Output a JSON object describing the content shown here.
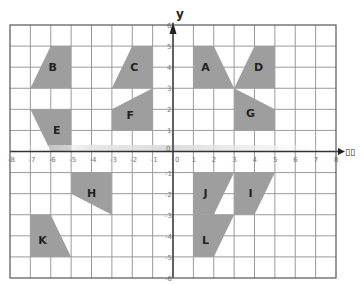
{
  "diagram": {
    "title": "",
    "x_axis_label": "x",
    "x_axis_label_rendered": "▯▯",
    "y_axis_label": "y",
    "x_range": [
      -8,
      8
    ],
    "y_range": [
      -6,
      6
    ],
    "x_ticks": [
      "-8",
      "-7",
      "-6",
      "-5",
      "-4",
      "-3",
      "-2",
      "-1",
      "0",
      "1",
      "2",
      "3",
      "4",
      "5",
      "6",
      "7",
      "8"
    ],
    "y_ticks": [
      "6",
      "5",
      "4",
      "3",
      "2",
      "1",
      "0",
      "-1",
      "-2",
      "-3",
      "-4",
      "-5",
      "-6"
    ],
    "shape_fill": "#9e9e9e",
    "grid_color": "#9a9a9a",
    "shapes": [
      {
        "label": "A",
        "points": [
          [
            1,
            5
          ],
          [
            2,
            5
          ],
          [
            3,
            3
          ],
          [
            1,
            3
          ]
        ],
        "label_pos": [
          1.6,
          4
        ]
      },
      {
        "label": "B",
        "points": [
          [
            -6,
            5
          ],
          [
            -5,
            5
          ],
          [
            -5,
            3
          ],
          [
            -7,
            3
          ]
        ],
        "label_pos": [
          -5.9,
          4
        ]
      },
      {
        "label": "C",
        "points": [
          [
            -2,
            5
          ],
          [
            -1,
            5
          ],
          [
            -1,
            3
          ],
          [
            -3,
            3
          ]
        ],
        "label_pos": [
          -1.9,
          4
        ]
      },
      {
        "label": "D",
        "points": [
          [
            4,
            5
          ],
          [
            5,
            5
          ],
          [
            5,
            3
          ],
          [
            3,
            3
          ]
        ],
        "label_pos": [
          4.2,
          4
        ]
      },
      {
        "label": "E",
        "points": [
          [
            -7,
            2
          ],
          [
            -5,
            2
          ],
          [
            -5,
            0
          ],
          [
            -6,
            0
          ]
        ],
        "label_pos": [
          -5.7,
          1
        ]
      },
      {
        "label": "F",
        "points": [
          [
            -3,
            2
          ],
          [
            -1,
            3
          ],
          [
            -1,
            1
          ],
          [
            -3,
            1
          ]
        ],
        "label_pos": [
          -2.1,
          1.7
        ]
      },
      {
        "label": "G",
        "points": [
          [
            3,
            3
          ],
          [
            5,
            2
          ],
          [
            5,
            1
          ],
          [
            3,
            1
          ]
        ],
        "label_pos": [
          3.8,
          1.8
        ]
      },
      {
        "label": "H",
        "points": [
          [
            -5,
            -1
          ],
          [
            -3,
            -1
          ],
          [
            -3,
            -3
          ],
          [
            -5,
            -2
          ]
        ],
        "label_pos": [
          -4,
          -2
        ]
      },
      {
        "label": "I",
        "points": [
          [
            3,
            -1
          ],
          [
            5,
            -1
          ],
          [
            4,
            -3
          ],
          [
            3,
            -3
          ]
        ],
        "label_pos": [
          3.8,
          -2
        ]
      },
      {
        "label": "J",
        "points": [
          [
            1,
            -1
          ],
          [
            3,
            -1
          ],
          [
            2,
            -3
          ],
          [
            1,
            -3
          ]
        ],
        "label_pos": [
          1.6,
          -2
        ]
      },
      {
        "label": "K",
        "points": [
          [
            -7,
            -3
          ],
          [
            -6,
            -3
          ],
          [
            -5,
            -5
          ],
          [
            -7,
            -5
          ]
        ],
        "label_pos": [
          -6.4,
          -4.2
        ]
      },
      {
        "label": "L",
        "points": [
          [
            1,
            -3
          ],
          [
            3,
            -3
          ],
          [
            2,
            -5
          ],
          [
            1,
            -5
          ]
        ],
        "label_pos": [
          1.6,
          -4.2
        ]
      }
    ]
  }
}
